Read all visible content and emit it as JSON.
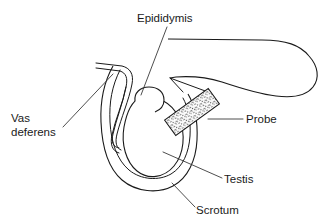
{
  "figure": {
    "background_color": "#ffffff",
    "ink_color": "#1a1a1a",
    "width": 327,
    "height": 221
  },
  "labels": {
    "epididymis": "Epididymis",
    "vas_deferens_line1": "Vas",
    "vas_deferens_line2": "deferens",
    "probe": "Probe",
    "testis": "Testis",
    "scrotum": "Scrotum"
  },
  "parts": {
    "finger": "finger",
    "probe": "probe",
    "testis": "testis",
    "epididymis": "epididymis",
    "scrotum": "scrotum",
    "vas_deferens": "vas-deferens"
  }
}
